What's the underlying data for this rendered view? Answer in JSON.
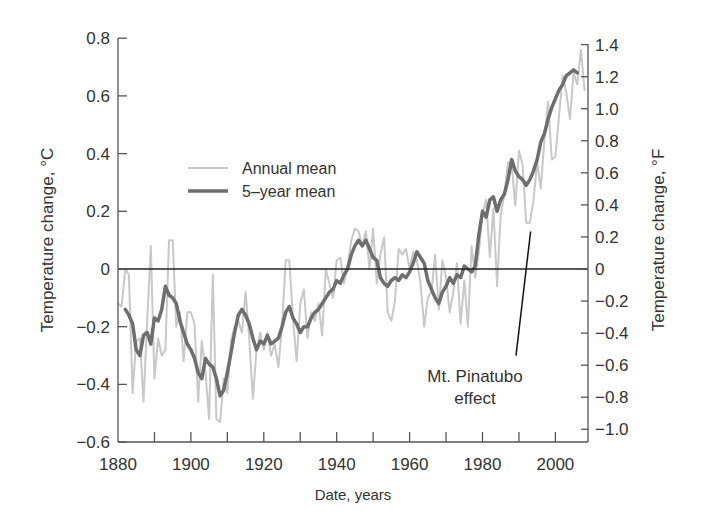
{
  "chart_data": {
    "type": "line",
    "title": "",
    "xlabel": "Date, years",
    "ylabel": "Temperature change, °C",
    "ylabel_right": "Temperature change, °F",
    "xlim": [
      1880,
      2009
    ],
    "ylim": [
      -0.6,
      0.8
    ],
    "ylim_right": [
      -1.08,
      1.44
    ],
    "grid": false,
    "legend_position": "upper-left-inside",
    "x_ticks": [
      1880,
      1890,
      1900,
      1910,
      1920,
      1930,
      1940,
      1950,
      1960,
      1970,
      1980,
      1990,
      2000
    ],
    "x_tick_labels": [
      "1880",
      "1900",
      "1920",
      "1940",
      "1960",
      "1980",
      "2000"
    ],
    "y_ticks": [
      "0.8",
      "0.6",
      "0.4",
      "0.2",
      "0",
      "−0.2",
      "−0.4",
      "−0.6"
    ],
    "y_tick_values": [
      0.8,
      0.6,
      0.4,
      0.2,
      0,
      -0.2,
      -0.4,
      -0.6
    ],
    "y_right_ticks": [
      "1.4",
      "1.2",
      "1.0",
      "0.8",
      "0.6",
      "0.4",
      "0.2",
      "0",
      "−0.2",
      "−0.4",
      "−0.6",
      "−0.8",
      "−1.0"
    ],
    "y_right_tick_values": [
      1.4,
      1.2,
      1.0,
      0.8,
      0.6,
      0.4,
      0.2,
      0,
      -0.2,
      -0.4,
      -0.6,
      -0.8,
      -1.0
    ],
    "reference_line": {
      "y": 0,
      "color": "#222222"
    },
    "series": [
      {
        "name": "Annual mean",
        "color": "#c8c8c8",
        "width": 2,
        "x": [
          1880,
          1881,
          1882,
          1883,
          1884,
          1885,
          1886,
          1887,
          1888,
          1889,
          1890,
          1891,
          1892,
          1893,
          1894,
          1895,
          1896,
          1897,
          1898,
          1899,
          1900,
          1901,
          1902,
          1903,
          1904,
          1905,
          1906,
          1907,
          1908,
          1909,
          1910,
          1911,
          1912,
          1913,
          1914,
          1915,
          1916,
          1917,
          1918,
          1919,
          1920,
          1921,
          1922,
          1923,
          1924,
          1925,
          1926,
          1927,
          1928,
          1929,
          1930,
          1931,
          1932,
          1933,
          1934,
          1935,
          1936,
          1937,
          1938,
          1939,
          1940,
          1941,
          1942,
          1943,
          1944,
          1945,
          1946,
          1947,
          1948,
          1949,
          1950,
          1951,
          1952,
          1953,
          1954,
          1955,
          1956,
          1957,
          1958,
          1959,
          1960,
          1961,
          1962,
          1963,
          1964,
          1965,
          1966,
          1967,
          1968,
          1969,
          1970,
          1971,
          1972,
          1973,
          1974,
          1975,
          1976,
          1977,
          1978,
          1979,
          1980,
          1981,
          1982,
          1983,
          1984,
          1985,
          1986,
          1987,
          1988,
          1989,
          1990,
          1991,
          1992,
          1993,
          1994,
          1995,
          1996,
          1997,
          1998,
          1999,
          2000,
          2001,
          2002,
          2003,
          2004,
          2005,
          2006,
          2007,
          2008
        ],
        "values": [
          -0.12,
          -0.13,
          0.0,
          -0.02,
          -0.43,
          -0.25,
          -0.24,
          -0.46,
          -0.18,
          0.08,
          -0.38,
          -0.24,
          -0.3,
          -0.28,
          0.1,
          0.1,
          -0.2,
          -0.15,
          -0.32,
          -0.15,
          -0.15,
          -0.19,
          -0.46,
          -0.25,
          -0.36,
          -0.52,
          -0.02,
          -0.52,
          -0.53,
          -0.38,
          -0.43,
          -0.25,
          -0.2,
          -0.18,
          -0.22,
          -0.08,
          -0.24,
          -0.45,
          -0.28,
          -0.22,
          -0.28,
          -0.22,
          -0.3,
          -0.26,
          -0.34,
          -0.2,
          0.03,
          0.03,
          -0.17,
          -0.32,
          -0.12,
          -0.07,
          -0.24,
          -0.15,
          -0.18,
          -0.12,
          -0.23,
          0.0,
          -0.05,
          -0.1,
          0.03,
          0.04,
          -0.05,
          0.01,
          0.1,
          0.14,
          0.13,
          0.08,
          0.13,
          0.0,
          0.14,
          -0.05,
          0.05,
          0.11,
          -0.15,
          -0.18,
          -0.11,
          0.07,
          0.05,
          0.07,
          0.0,
          0.06,
          0.03,
          -0.05,
          -0.2,
          -0.1,
          -0.08,
          0.05,
          -0.14,
          0.03,
          -0.03,
          -0.15,
          -0.08,
          0.02,
          -0.19,
          -0.04,
          -0.2,
          0.08,
          -0.03,
          0.06,
          0.19,
          0.24,
          0.04,
          0.21,
          -0.06,
          0.19,
          0.26,
          0.37,
          0.36,
          0.22,
          0.41,
          0.36,
          0.16,
          0.16,
          0.24,
          0.37,
          0.28,
          0.45,
          0.58,
          0.38,
          0.39,
          0.53,
          0.67,
          0.61,
          0.52,
          0.68,
          0.64,
          0.76,
          0.62
        ]
      },
      {
        "name": "5-year mean",
        "color": "#6e6e6e",
        "width": 3.5,
        "x": [
          1882,
          1883,
          1884,
          1885,
          1886,
          1887,
          1888,
          1889,
          1890,
          1891,
          1892,
          1893,
          1894,
          1895,
          1896,
          1897,
          1898,
          1899,
          1900,
          1901,
          1902,
          1903,
          1904,
          1905,
          1906,
          1907,
          1908,
          1909,
          1910,
          1911,
          1912,
          1913,
          1914,
          1915,
          1916,
          1917,
          1918,
          1919,
          1920,
          1921,
          1922,
          1923,
          1924,
          1925,
          1926,
          1927,
          1928,
          1929,
          1930,
          1931,
          1932,
          1933,
          1934,
          1935,
          1936,
          1937,
          1938,
          1939,
          1940,
          1941,
          1942,
          1943,
          1944,
          1945,
          1946,
          1947,
          1948,
          1949,
          1950,
          1951,
          1952,
          1953,
          1954,
          1955,
          1956,
          1957,
          1958,
          1959,
          1960,
          1961,
          1962,
          1963,
          1964,
          1965,
          1966,
          1967,
          1968,
          1969,
          1970,
          1971,
          1972,
          1973,
          1974,
          1975,
          1976,
          1977,
          1978,
          1979,
          1980,
          1981,
          1982,
          1983,
          1984,
          1985,
          1986,
          1987,
          1988,
          1989,
          1990,
          1991,
          1992,
          1993,
          1994,
          1995,
          1996,
          1997,
          1998,
          1999,
          2000,
          2001,
          2002,
          2003,
          2004,
          2005,
          2006
        ],
        "values": [
          -0.14,
          -0.16,
          -0.19,
          -0.28,
          -0.3,
          -0.23,
          -0.22,
          -0.26,
          -0.17,
          -0.18,
          -0.14,
          -0.06,
          -0.09,
          -0.1,
          -0.12,
          -0.18,
          -0.22,
          -0.26,
          -0.28,
          -0.31,
          -0.36,
          -0.38,
          -0.31,
          -0.33,
          -0.34,
          -0.38,
          -0.44,
          -0.42,
          -0.36,
          -0.29,
          -0.22,
          -0.16,
          -0.14,
          -0.16,
          -0.19,
          -0.24,
          -0.28,
          -0.25,
          -0.26,
          -0.23,
          -0.26,
          -0.25,
          -0.24,
          -0.2,
          -0.15,
          -0.13,
          -0.17,
          -0.19,
          -0.22,
          -0.2,
          -0.2,
          -0.17,
          -0.15,
          -0.14,
          -0.12,
          -0.1,
          -0.08,
          -0.07,
          -0.04,
          -0.05,
          -0.02,
          0.0,
          0.05,
          0.08,
          0.1,
          0.08,
          0.1,
          0.07,
          0.04,
          0.03,
          -0.03,
          -0.05,
          -0.06,
          -0.04,
          -0.03,
          -0.04,
          -0.02,
          -0.03,
          -0.01,
          0.02,
          0.06,
          0.04,
          0.02,
          -0.04,
          -0.07,
          -0.1,
          -0.12,
          -0.08,
          -0.06,
          -0.03,
          -0.05,
          -0.02,
          -0.03,
          0.01,
          0.0,
          -0.01,
          0.01,
          0.12,
          0.2,
          0.18,
          0.24,
          0.25,
          0.2,
          0.24,
          0.26,
          0.31,
          0.38,
          0.34,
          0.32,
          0.31,
          0.29,
          0.31,
          0.34,
          0.38,
          0.44,
          0.47,
          0.52,
          0.56,
          0.59,
          0.62,
          0.64,
          0.67,
          0.68,
          0.69,
          0.68
        ]
      }
    ],
    "annotations": [
      {
        "text_lines": [
          "Mt. Pinatubo",
          "effect"
        ],
        "pointer_from": [
          1989.2,
          -0.3
        ],
        "pointer_to": [
          1993.2,
          0.13
        ]
      }
    ]
  },
  "legend": {
    "items": [
      {
        "label": "Annual mean",
        "color": "#c8c8c8"
      },
      {
        "label": "5–year mean",
        "color": "#6e6e6e"
      }
    ]
  },
  "labels": {
    "xlabel": "Date, years",
    "ylabel_left": "Temperature change, °C",
    "ylabel_right": "Temperature change, °F",
    "annotation_line1": "Mt. Pinatubo",
    "annotation_line2": "effect"
  }
}
